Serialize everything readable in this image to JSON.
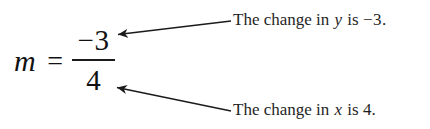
{
  "figure": {
    "background_color": "#ffffff",
    "ink_color": "#1a1a1a",
    "width": 430,
    "height": 129
  },
  "equation": {
    "variable": "m",
    "relation": "=",
    "numerator": "−3",
    "denominator": "4",
    "full_text": "m = −3/4"
  },
  "annotations": {
    "top": {
      "text_before_var": "The change in ",
      "variable": "y",
      "text_after_var": " is ",
      "value": "−3.",
      "full_text": "The change in y is −3.",
      "target": "numerator"
    },
    "bottom": {
      "text_before_var": "The change in ",
      "variable": "x",
      "text_after_var": " is ",
      "value": "4.",
      "full_text": "The change in x is 4.",
      "target": "denominator"
    }
  },
  "arrows": [
    {
      "name": "arrow-to-numerator",
      "from_x": 231,
      "from_y": 21,
      "to_x": 114,
      "to_y": 35
    },
    {
      "name": "arrow-to-denominator",
      "from_x": 231,
      "from_y": 111,
      "to_x": 113,
      "to_y": 87
    }
  ]
}
